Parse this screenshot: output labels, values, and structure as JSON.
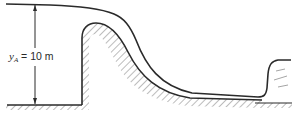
{
  "figure": {
    "type": "spillway-hydraulic-jump",
    "depth_label": {
      "variable": "y",
      "subscript": "A",
      "equals": "=",
      "value": "10 m"
    },
    "colors": {
      "line": "#2a2a2a",
      "hatch": "#6a6a6a",
      "background": "#ffffff"
    }
  }
}
